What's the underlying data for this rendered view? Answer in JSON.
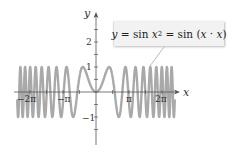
{
  "chart_data": {
    "type": "line",
    "title": "",
    "function": "y = sin(x^2)",
    "annotation": "y = sin x² = sin (x · x)",
    "xlabel": "x",
    "ylabel": "y",
    "xlim": [
      -7.6,
      7.6
    ],
    "ylim": [
      -1.9,
      3.1
    ],
    "x_ticks": [
      -6.2832,
      -3.1416,
      3.1416,
      6.2832
    ],
    "x_tick_labels": [
      "−2π",
      "−π",
      "π",
      "2π"
    ],
    "y_ticks": [
      -1,
      1,
      2
    ],
    "y_tick_labels": [
      "−1",
      "1",
      "2"
    ],
    "series": [
      {
        "name": "y = sin x²",
        "x_range": [
          -7.5,
          7.5
        ],
        "color": "#aaaaaa"
      }
    ],
    "grid": false,
    "legend": "callout box upper right"
  },
  "colors": {
    "curve": "#a9a9a9",
    "axis": "#555555",
    "callout_bg": "#f2f2f2"
  },
  "callout": {
    "lhs": "y",
    "eq1": " = sin ",
    "x1": "x",
    "sq": "2",
    "eq2": " = sin (",
    "x2": "x",
    "dot": " · ",
    "x3": "x",
    "close": ")"
  },
  "axes": {
    "x_name": "x",
    "y_name": "y",
    "x_labels": [
      "−2π",
      "−π",
      "π",
      "2π"
    ],
    "y_labels": [
      "2",
      "1",
      "−1"
    ]
  }
}
